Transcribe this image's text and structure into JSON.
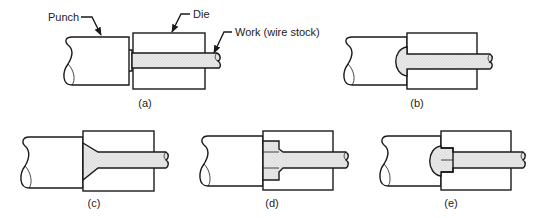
{
  "figure": {
    "callouts": {
      "punch": "Punch",
      "die": "Die",
      "work": "Work (wire stock)"
    },
    "panels": [
      {
        "id": "a",
        "caption": "(a)",
        "description": "Wire stock positioned in die, punch approaching"
      },
      {
        "id": "b",
        "caption": "(b)",
        "description": "Round head formed by punch cavity"
      },
      {
        "id": "c",
        "caption": "(c)",
        "description": "Countersunk (flat) head formed in die recess"
      },
      {
        "id": "d",
        "caption": "(d)",
        "description": "Square/hex head formed in die pocket"
      },
      {
        "id": "e",
        "caption": "(e)",
        "description": "Combined head: domed portion in punch and shoulder in die"
      }
    ],
    "colors": {
      "line": "#1a1a1a",
      "work_fill": "#e6e6e6",
      "background": "#ffffff"
    }
  }
}
